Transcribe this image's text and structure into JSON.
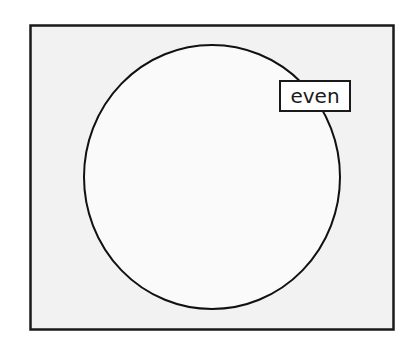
{
  "diagram": {
    "type": "venn-single-set",
    "universe": {
      "fill": "#f2f2f2",
      "stroke": "#1a1a1a"
    },
    "set": {
      "label": "even",
      "fill": "#fafafa",
      "stroke": "#111111"
    }
  }
}
